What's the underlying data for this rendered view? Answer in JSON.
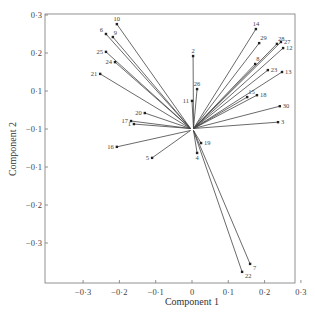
{
  "chart_data": {
    "type": "scatter",
    "subtype": "biplot-vectors",
    "title": "",
    "xlabel": "Component 1",
    "ylabel": "Component 2",
    "xlim": [
      -0.4,
      0.3
    ],
    "ylim": [
      -0.4,
      0.3
    ],
    "grid": false,
    "legend": null,
    "x_ticks": [
      {
        "value": -0.3,
        "label": "−0·3"
      },
      {
        "value": -0.2,
        "label": "−0·2"
      },
      {
        "value": -0.1,
        "label": "−0·1"
      },
      {
        "value": 0,
        "label": "0"
      },
      {
        "value": 0.1,
        "label": "0·1"
      },
      {
        "value": 0.2,
        "label": "0·2"
      },
      {
        "value": 0.3,
        "label": "0·3"
      }
    ],
    "y_ticks": [
      {
        "value": 0.3,
        "label": "0·3"
      },
      {
        "value": 0.2,
        "label": "0·2"
      },
      {
        "value": 0.1,
        "label": "0·1"
      },
      {
        "value": 0,
        "label": "−0·1"
      },
      {
        "value": -0.1,
        "label": "−0·1"
      },
      {
        "value": -0.2,
        "label": "−0·2"
      },
      {
        "value": -0.3,
        "label": "−0·3"
      }
    ],
    "origin": [
      0,
      0
    ],
    "points": [
      {
        "label": "1",
        "x": -0.16,
        "y": 0.013
      },
      {
        "label": "2",
        "x": 0.003,
        "y": 0.192
      },
      {
        "label": "3",
        "x": 0.237,
        "y": 0.018
      },
      {
        "label": "4",
        "x": 0.014,
        "y": -0.063
      },
      {
        "label": "5",
        "x": -0.11,
        "y": -0.076
      },
      {
        "label": "6",
        "x": -0.237,
        "y": 0.25
      },
      {
        "label": "7",
        "x": 0.16,
        "y": -0.355
      },
      {
        "label": "8",
        "x": 0.174,
        "y": 0.171
      },
      {
        "label": "9",
        "x": -0.218,
        "y": 0.242
      },
      {
        "label": "10",
        "x": -0.207,
        "y": 0.276
      },
      {
        "label": "11",
        "x": 0.0,
        "y": 0.074
      },
      {
        "label": "12",
        "x": 0.251,
        "y": 0.213
      },
      {
        "label": "13",
        "x": 0.248,
        "y": 0.15
      },
      {
        "label": "14",
        "x": 0.176,
        "y": 0.263
      },
      {
        "label": "15",
        "x": 0.152,
        "y": 0.084
      },
      {
        "label": "16",
        "x": -0.207,
        "y": -0.047
      },
      {
        "label": "17",
        "x": -0.168,
        "y": 0.021
      },
      {
        "label": "18",
        "x": 0.179,
        "y": 0.089
      },
      {
        "label": "19",
        "x": 0.025,
        "y": -0.037
      },
      {
        "label": "20",
        "x": -0.13,
        "y": 0.042
      },
      {
        "label": "21",
        "x": -0.253,
        "y": 0.145
      },
      {
        "label": "22",
        "x": 0.138,
        "y": -0.376
      },
      {
        "label": "23",
        "x": 0.209,
        "y": 0.155
      },
      {
        "label": "24",
        "x": -0.212,
        "y": 0.176
      },
      {
        "label": "25",
        "x": -0.237,
        "y": 0.203
      },
      {
        "label": "26",
        "x": 0.014,
        "y": 0.105
      },
      {
        "label": "27",
        "x": 0.245,
        "y": 0.229
      },
      {
        "label": "28",
        "x": 0.234,
        "y": 0.224
      },
      {
        "label": "29",
        "x": 0.185,
        "y": 0.226
      },
      {
        "label": "30",
        "x": 0.242,
        "y": 0.06
      }
    ]
  },
  "layout": {
    "plot_left": 45,
    "plot_right": 295,
    "plot_top": 14,
    "plot_bottom": 283,
    "x0_px": 192,
    "y0_px": 129,
    "px_per_unit_x": 363,
    "px_per_unit_y": 380
  }
}
